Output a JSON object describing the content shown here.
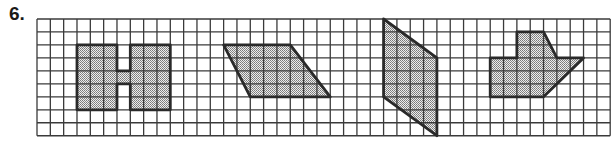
{
  "problem": {
    "number": "6."
  },
  "grid": {
    "origin_px": [
      37,
      19
    ],
    "cell_w": 13.33,
    "cell_h": 12.97,
    "cols": 43,
    "rows": 9,
    "line_color": "#3a3a3a",
    "outline_color": "#2a2a2a",
    "fill_color": "#b8b8b8"
  },
  "shapes": [
    {
      "name": "h-shape",
      "points": [
        [
          3,
          2
        ],
        [
          6,
          2
        ],
        [
          6,
          4
        ],
        [
          7,
          4
        ],
        [
          7,
          2
        ],
        [
          10,
          2
        ],
        [
          10,
          7
        ],
        [
          7,
          7
        ],
        [
          7,
          5
        ],
        [
          6,
          5
        ],
        [
          6,
          7
        ],
        [
          3,
          7
        ]
      ]
    },
    {
      "name": "slanted-quadrilateral",
      "points": [
        [
          14,
          2
        ],
        [
          19,
          2
        ],
        [
          22,
          6
        ],
        [
          16,
          6
        ]
      ]
    },
    {
      "name": "vertical-parallelogram",
      "points": [
        [
          26,
          0
        ],
        [
          30,
          3
        ],
        [
          30,
          9
        ],
        [
          26,
          6
        ]
      ]
    },
    {
      "name": "arrow-house-shape",
      "points": [
        [
          36,
          1
        ],
        [
          38,
          1
        ],
        [
          39,
          3
        ],
        [
          41,
          3
        ],
        [
          38,
          6
        ],
        [
          34,
          6
        ],
        [
          34,
          3
        ],
        [
          36,
          3
        ]
      ]
    }
  ]
}
